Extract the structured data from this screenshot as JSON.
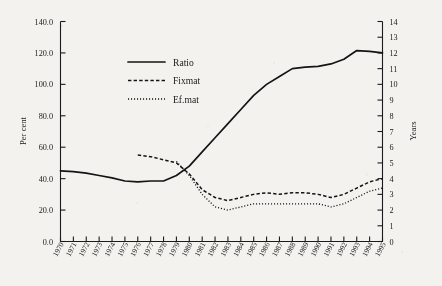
{
  "chart_data": {
    "type": "line",
    "title": "",
    "subtitle": "",
    "xlabel": "",
    "ylabel": "Per cent",
    "y2label": "Years",
    "grid": false,
    "legend_position": "upper-left-inside",
    "x": [
      1970,
      1971,
      1972,
      1973,
      1974,
      1975,
      1976,
      1977,
      1978,
      1979,
      1980,
      1981,
      1982,
      1983,
      1984,
      1985,
      1986,
      1987,
      1988,
      1989,
      1990,
      1991,
      1992,
      1993,
      1994,
      1995
    ],
    "xtick_labels": [
      "1970",
      "1971",
      "1972",
      "1973",
      "1974",
      "1975",
      "1976",
      "1977",
      "1978",
      "1979",
      "1980",
      "1981",
      "1982",
      "1983",
      "1984",
      "1985",
      "1986",
      "1987",
      "1988",
      "1989",
      "1990",
      "1991",
      "1992",
      "1993",
      "1994",
      "1995"
    ],
    "ylim": [
      0.0,
      140.0
    ],
    "ytick_labels": [
      "0.0",
      "20.0",
      "40.0",
      "60.0",
      "80.0",
      "100.0",
      "120.0",
      "140.0"
    ],
    "yticks": [
      0,
      20,
      40,
      60,
      80,
      100,
      120,
      140
    ],
    "y2lim": [
      0,
      14
    ],
    "y2ticks": [
      0,
      1,
      2,
      3,
      4,
      5,
      6,
      7,
      8,
      9,
      10,
      11,
      12,
      13,
      14
    ],
    "y2tick_labels": [
      "0",
      "1",
      "2",
      "3",
      "4",
      "5",
      "6",
      "7",
      "8",
      "9",
      "10",
      "11",
      "12",
      "13",
      "14"
    ],
    "series": [
      {
        "name": "Ratio",
        "axis": "left",
        "style": "solid",
        "color": "#141414",
        "x": [
          1970,
          1971,
          1972,
          1973,
          1974,
          1975,
          1976,
          1977,
          1978,
          1979,
          1980,
          1981,
          1982,
          1983,
          1984,
          1985,
          1986,
          1987,
          1988,
          1989,
          1990,
          1991,
          1992,
          1993,
          1994,
          1995
        ],
        "values": [
          45.0,
          44.5,
          43.5,
          42.0,
          40.5,
          38.5,
          38.0,
          38.5,
          38.5,
          42.0,
          48.0,
          57.0,
          66.0,
          75.0,
          84.0,
          93.0,
          100.0,
          105.0,
          110.0,
          111.0,
          111.5,
          113.0,
          116.0,
          121.5,
          121.0,
          120.0
        ]
      },
      {
        "name": "Fixmat",
        "axis": "right",
        "style": "dashed",
        "color": "#141414",
        "x": [
          1976,
          1977,
          1978,
          1979,
          1980,
          1981,
          1982,
          1983,
          1984,
          1985,
          1986,
          1987,
          1988,
          1989,
          1990,
          1991,
          1992,
          1993,
          1994,
          1995
        ],
        "values": [
          5.5,
          5.4,
          5.2,
          5.0,
          4.3,
          3.3,
          2.8,
          2.6,
          2.8,
          3.0,
          3.1,
          3.0,
          3.1,
          3.1,
          3.0,
          2.8,
          3.0,
          3.4,
          3.8,
          4.0
        ]
      },
      {
        "name": "Ef.mat",
        "axis": "right",
        "style": "dotted",
        "color": "#141414",
        "x": [
          1979,
          1980,
          1981,
          1982,
          1983,
          1984,
          1985,
          1986,
          1987,
          1988,
          1989,
          1990,
          1991,
          1992,
          1993,
          1994,
          1995
        ],
        "values": [
          5.1,
          4.2,
          3.0,
          2.2,
          2.0,
          2.2,
          2.4,
          2.4,
          2.4,
          2.4,
          2.4,
          2.4,
          2.2,
          2.4,
          2.8,
          3.2,
          3.4
        ]
      }
    ],
    "legend": [
      {
        "label": "Ratio",
        "style": "solid"
      },
      {
        "label": "Fixmat",
        "style": "dashed"
      },
      {
        "label": "Ef.mat",
        "style": "dotted"
      }
    ]
  }
}
